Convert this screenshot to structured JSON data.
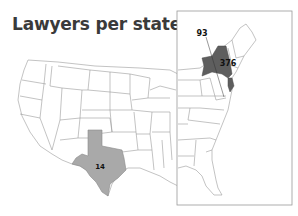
{
  "title": "Lawyers per state",
  "colors": {
    "background": "#ffffff",
    "state_fill": "#ffffff",
    "state_stroke": "#9a9a9a",
    "texas_fill": "#a9a9a9",
    "newyork_fill": "#5e5e5e",
    "inset_border": "#9a9a9a",
    "label": "#111111"
  },
  "main_map": {
    "highlighted_states": [
      {
        "state": "Texas",
        "label": "14",
        "shade": "medium-gray"
      }
    ]
  },
  "inset_map": {
    "region": "Eastern US",
    "highlighted_states": [
      {
        "state": "New York",
        "label": "376",
        "shade": "dark-gray"
      },
      {
        "state": "New Jersey",
        "label": "",
        "shade": "dark-gray"
      }
    ],
    "callouts": [
      {
        "label": "93",
        "target": "District of Columbia"
      }
    ]
  },
  "labels": {
    "texas": "14",
    "newyork": "376",
    "dc": "93"
  }
}
